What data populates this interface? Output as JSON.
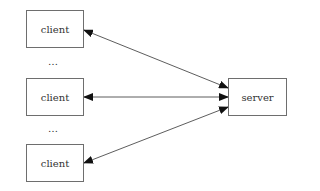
{
  "diagram": {
    "type": "client-server",
    "nodes": [
      {
        "id": "client1",
        "label": "client",
        "x": 26,
        "y": 10,
        "w": 58,
        "h": 38
      },
      {
        "id": "client2",
        "label": "client",
        "x": 26,
        "y": 78,
        "w": 58,
        "h": 38
      },
      {
        "id": "client3",
        "label": "client",
        "x": 26,
        "y": 144,
        "w": 58,
        "h": 38
      },
      {
        "id": "server",
        "label": "server",
        "x": 228,
        "y": 78,
        "w": 59,
        "h": 38
      }
    ],
    "ellipses": [
      {
        "text": "…",
        "x": 48,
        "y": 58
      },
      {
        "text": "…",
        "x": 48,
        "y": 125
      }
    ],
    "edges": [
      {
        "from": "client1",
        "to": "server",
        "bidirectional": true
      },
      {
        "from": "client2",
        "to": "server",
        "bidirectional": true
      },
      {
        "from": "client3",
        "to": "server",
        "bidirectional": true
      }
    ]
  },
  "labels": {
    "client1": "client",
    "client2": "client",
    "client3": "client",
    "server": "server",
    "ellipsis_top": "…",
    "ellipsis_bottom": "…"
  }
}
